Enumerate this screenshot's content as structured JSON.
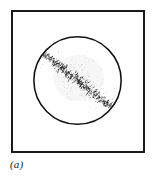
{
  "figure": {
    "caption": "(a)",
    "background_color": "#ffffff",
    "frame": {
      "name": "plot-frame",
      "border_color": "#1a1a1a",
      "border_width_px": 2,
      "x": 11,
      "y": 10,
      "width": 134,
      "height": 143
    }
  },
  "chart_data": {
    "type": "scatter",
    "title": "",
    "subtitle": "",
    "xlabel": "",
    "ylabel": "",
    "annotations": [
      "(a)"
    ],
    "legend": [],
    "legend_position": "none",
    "grid": false,
    "axis_ticks": [],
    "xlim": [
      0,
      134
    ],
    "ylim": [
      0,
      143
    ],
    "elements": [
      {
        "name": "aperture-circle",
        "shape": "circle",
        "cx": 66.5,
        "cy": 70.5,
        "r": 45,
        "stroke": "#111111",
        "stroke_width": 1.6,
        "fill": "none"
      },
      {
        "name": "speckle-band",
        "shape": "band",
        "x1": 31,
        "y1": 42,
        "x2": 104,
        "y2": 100,
        "angle_deg": 38,
        "half_width": 5.5,
        "marker_count": 520,
        "marker_color": "#1a1a1a",
        "marker_kind": "short-dash"
      },
      {
        "name": "diffuse-halo",
        "shape": "ellipse",
        "cx": 68,
        "cy": 68,
        "rx": 26,
        "ry": 24,
        "fill": "#9a9a9a",
        "opacity": 0.16,
        "speckle_count": 230
      }
    ],
    "series": [
      {
        "name": "speckle-band",
        "point_count": 520,
        "extent": {
          "x1": 31,
          "y1": 42,
          "x2": 104,
          "y2": 100
        }
      },
      {
        "name": "diffuse-halo",
        "point_count": 230,
        "extent": {
          "x1": 42,
          "y1": 44,
          "x2": 94,
          "y2": 92
        }
      }
    ]
  }
}
